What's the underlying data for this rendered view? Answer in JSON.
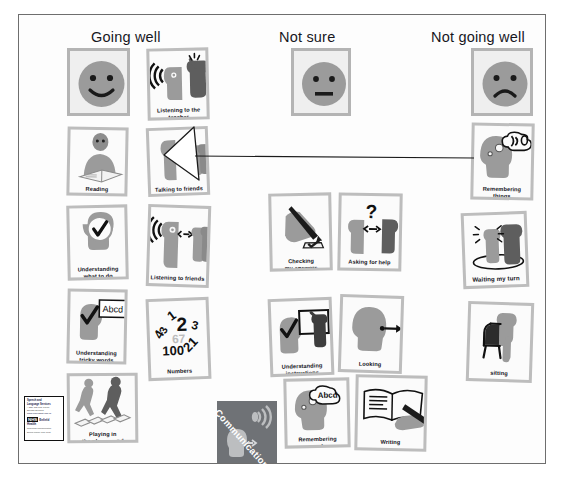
{
  "board": {
    "title": "Communication skills sorting board",
    "columns": [
      {
        "id": "going-well",
        "label": "Going well"
      },
      {
        "id": "not-sure",
        "label": "Not sure"
      },
      {
        "id": "not-going-well",
        "label": "Not going  well"
      }
    ],
    "faces": [
      {
        "id": "happy-face",
        "icon": "happy-face-icon",
        "column": "going-well"
      },
      {
        "id": "neutral-face",
        "icon": "neutral-face-icon",
        "column": "not-sure"
      },
      {
        "id": "sad-face",
        "icon": "sad-face-icon",
        "column": "not-going-well"
      }
    ],
    "cards": [
      {
        "id": "listening-to-the-teacher",
        "label": "Listening to the\nteacher",
        "column": "going-well"
      },
      {
        "id": "reading",
        "label": "Reading",
        "column": "going-well"
      },
      {
        "id": "talking-to-friends",
        "label": "Talking to friends",
        "column": "going-well"
      },
      {
        "id": "understanding-what-to-do",
        "label": "Understanding\nwhat to do",
        "column": "going-well"
      },
      {
        "id": "listening-to-friends",
        "label": "Listening to friends",
        "column": "going-well"
      },
      {
        "id": "understanding-tricky-words",
        "label": "Understanding\ntricky words",
        "column": "going-well"
      },
      {
        "id": "numbers",
        "label": "Numbers",
        "column": "going-well"
      },
      {
        "id": "playing-in-the-playground",
        "label": "Playing in\nthe playground",
        "column": "going-well"
      },
      {
        "id": "checking-my-answers",
        "label": "Checking\nmy answers",
        "column": "not-sure"
      },
      {
        "id": "asking-for-help",
        "label": "Asking for help",
        "column": "not-sure"
      },
      {
        "id": "understanding-instructions",
        "label": "Understanding\ninstructions",
        "column": "not-sure"
      },
      {
        "id": "looking",
        "label": "Looking",
        "column": "not-sure"
      },
      {
        "id": "remembering-words",
        "label": "Remembering\nwords",
        "column": "not-sure"
      },
      {
        "id": "writing",
        "label": "Writing",
        "column": "not-sure"
      },
      {
        "id": "remembering-things",
        "label": "Remembering\nthings",
        "column": "not-going-well"
      },
      {
        "id": "waiting-my-turn",
        "label": "Waiting my turn",
        "column": "not-going-well"
      },
      {
        "id": "sitting",
        "label": "sitting",
        "column": "not-going-well"
      }
    ],
    "communication_tile": {
      "label": "Communication",
      "icon": "speech-sound-icon"
    },
    "numbers_card_digits": [
      "1",
      "2",
      "3",
      "4",
      "3",
      "67",
      "100",
      "21"
    ],
    "word_bubble_text": "Abcd",
    "thought_bubble_text": "Abcd",
    "question_mark": "?",
    "logo": {
      "line1": "Speech and",
      "line2": "Language Services",
      "line3": "A Stay and Play Friend",
      "line4": "Specific Services",
      "url": "www.enfieldsalt.nhs.uk",
      "nhs_mark": "NHS",
      "nhs_trust": "Enfield",
      "nhs_sub": "Health",
      "footer1": "Supporting Communication",
      "footer2": "Enfield Primary Care Trust"
    },
    "annotation_arrow": {
      "from": "remembering-things",
      "direction": "left",
      "icon": "arrow-left-icon"
    },
    "colors": {
      "silhouette": "#9b9b9b",
      "silhouette_dark": "#5e5e5e",
      "card_border": "#bdbdbd",
      "card_bg": "#fbfbfb",
      "face_bg": "#efefef",
      "tile_bg": "#6f7276",
      "board_border": "#6e6e6e",
      "text": "#12121a"
    }
  }
}
